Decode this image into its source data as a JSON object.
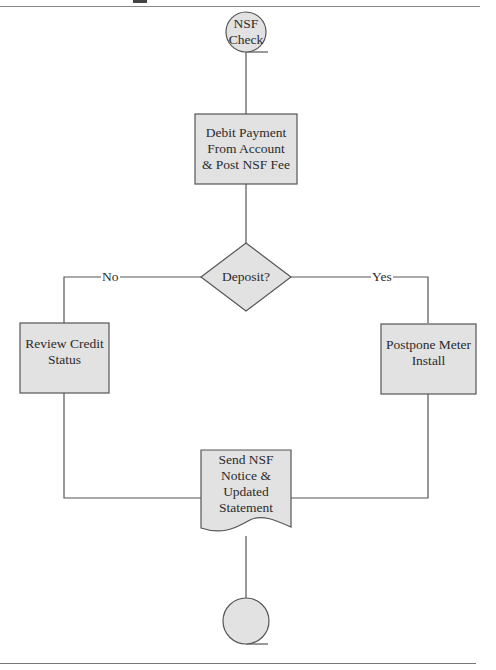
{
  "diagram": {
    "type": "flowchart",
    "nodes": {
      "start": {
        "shape": "circle",
        "label_line1": "NSF",
        "label_line2": "Check"
      },
      "debit": {
        "shape": "rectangle",
        "label_line1": "Debit Payment",
        "label_line2": "From Account",
        "label_line3": "& Post NSF Fee"
      },
      "decision": {
        "shape": "diamond",
        "label": "Deposit?"
      },
      "review": {
        "shape": "rectangle",
        "label_line1": "Review Credit",
        "label_line2": "Status"
      },
      "postpone": {
        "shape": "rectangle",
        "label_line1": "Postpone Meter",
        "label_line2": "Install"
      },
      "send": {
        "shape": "document",
        "label_line1": "Send NSF",
        "label_line2": "Notice &",
        "label_line3": "Updated",
        "label_line4": "Statement"
      },
      "end": {
        "shape": "circle",
        "label": ""
      }
    },
    "edges": {
      "no_label": "No",
      "yes_label": "Yes"
    },
    "colors": {
      "fill": "#e2e2e2",
      "stroke": "#555555",
      "line": "#555555",
      "rule": "#8a8a8a"
    }
  }
}
